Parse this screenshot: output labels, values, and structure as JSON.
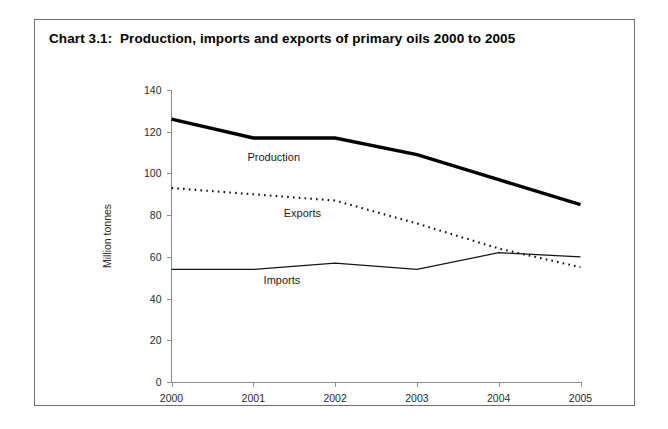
{
  "card": {
    "title": "Chart 3.1:  Production, imports and exports of primary oils 2000 to 2005"
  },
  "chart_data": {
    "type": "line",
    "title": "Chart 3.1:  Production, imports and exports of primary oils 2000 to 2005",
    "xlabel": "",
    "ylabel": "Million tonnes",
    "categories": [
      "2000",
      "2001",
      "2002",
      "2003",
      "2004",
      "2005"
    ],
    "x": [
      2000,
      2001,
      2002,
      2003,
      2004,
      2005
    ],
    "ylim": [
      0,
      140
    ],
    "yticks": [
      0,
      20,
      40,
      60,
      80,
      100,
      120,
      140
    ],
    "ytick_labels": [
      "0",
      "20",
      "40",
      "60",
      "80",
      "100",
      "120",
      "140"
    ],
    "xtick_labels": [
      "2000",
      "2001",
      "2002",
      "2003",
      "2004",
      "2005"
    ],
    "grid": false,
    "legend": "inline-labels",
    "series": [
      {
        "name": "Production",
        "style": "solid-thick",
        "values": [
          126,
          117,
          117,
          109,
          97,
          85
        ],
        "label": "Production"
      },
      {
        "name": "Exports",
        "style": "dotted",
        "values": [
          93,
          90,
          87,
          76,
          64,
          55
        ],
        "label": "Exports"
      },
      {
        "name": "Imports",
        "style": "solid-thin",
        "values": [
          54,
          54,
          57,
          54,
          62,
          60
        ],
        "label": "Imports"
      }
    ],
    "annotations": [
      {
        "text": "Production",
        "x": 2001.25,
        "y": 106
      },
      {
        "text": "Exports",
        "x": 2001.6,
        "y": 79
      },
      {
        "text": "Imports",
        "x": 2001.35,
        "y": 47
      }
    ]
  }
}
